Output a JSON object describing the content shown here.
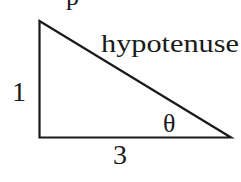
{
  "diagram": {
    "type": "right-triangle",
    "stroke_color": "#1a1a1a",
    "labels": {
      "hypotenuse": "hypotenuse",
      "vertical_side": "1",
      "horizontal_side": "3",
      "angle": "θ"
    },
    "top_fragment": "p"
  }
}
